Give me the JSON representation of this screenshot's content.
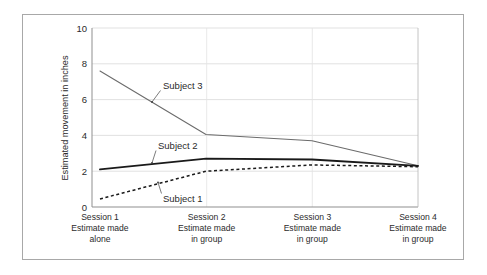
{
  "chart_data": {
    "type": "line",
    "title": "",
    "xlabel": "",
    "ylabel": "Estimated movement in inches",
    "ylim": [
      0,
      10
    ],
    "yticks": [
      0,
      2,
      4,
      6,
      8,
      10
    ],
    "ytick_labels": [
      "0",
      "2",
      "4",
      "6",
      "8",
      "10"
    ],
    "grid": true,
    "grid_axis": "y",
    "legend": "annotations-inline",
    "categories": [
      "Session 1\nEstimate made\nalone",
      "Session 2\nEstimate made\nin group",
      "Session 3\nEstimate made\nin group",
      "Session 4\nEstimate made\nin group"
    ],
    "x": [
      1,
      2,
      3,
      4
    ],
    "series": [
      {
        "name": "Subject 3",
        "values": [
          7.6,
          4.05,
          3.7,
          2.3
        ],
        "style": "solid-thin",
        "color": "#6b6b6b"
      },
      {
        "name": "Subject 2",
        "values": [
          2.1,
          2.7,
          2.65,
          2.3
        ],
        "style": "solid-thick",
        "color": "#1a1a1a"
      },
      {
        "name": "Subject 1",
        "values": [
          0.45,
          2.0,
          2.35,
          2.25
        ],
        "style": "dashed",
        "color": "#1a1a1a"
      }
    ],
    "annotations": [
      {
        "text": "Subject 3",
        "series": "Subject 3"
      },
      {
        "text": "Subject 2",
        "series": "Subject 2"
      },
      {
        "text": "Subject 1",
        "series": "Subject 1"
      }
    ]
  },
  "axis": {
    "y_title": "Estimated movement in inches",
    "ticks": {
      "t10": "10",
      "t8": "8",
      "t6": "6",
      "t4": "4",
      "t2": "2",
      "t0": "0"
    }
  },
  "categories": [
    {
      "line1": "Session 1",
      "line2": "Estimate made",
      "line3": "alone"
    },
    {
      "line1": "Session 2",
      "line2": "Estimate made",
      "line3": "in group"
    },
    {
      "line1": "Session 3",
      "line2": "Estimate made",
      "line3": "in group"
    },
    {
      "line1": "Session 4",
      "line2": "Estimate made",
      "line3": "in group"
    }
  ],
  "annotations": {
    "subject3": "Subject 3",
    "subject2": "Subject 2",
    "subject1": "Subject 1"
  },
  "colors": {
    "frame": "#a8a8a8",
    "axis": "#9a9a9a",
    "grid": "#d9d9d9",
    "subject3": "#6b6b6b",
    "subject2": "#1a1a1a",
    "subject1": "#1a1a1a",
    "text": "#2b2b2b",
    "background": "#ffffff"
  }
}
